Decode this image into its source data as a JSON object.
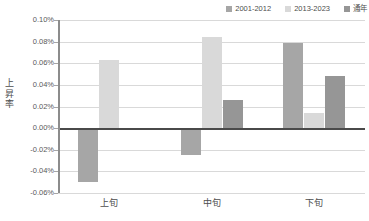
{
  "chart_data": {
    "type": "bar",
    "title": "",
    "xlabel": "",
    "ylabel": "上昇率",
    "categories": [
      "上旬",
      "中旬",
      "下旬"
    ],
    "series": [
      {
        "name": "2001-2012",
        "values": [
          -0.05,
          -0.025,
          0.079
        ],
        "color": "#a6a6a6"
      },
      {
        "name": "2013-2023",
        "values": [
          0.063,
          0.084,
          0.014
        ],
        "color": "#d9d9d9"
      },
      {
        "name": "通年",
        "values": [
          0.0,
          0.026,
          0.048
        ],
        "color": "#969696"
      }
    ],
    "ylim": [
      -0.06,
      0.1
    ],
    "ytick_step": 0.02,
    "ytick_labels": [
      "0.10%",
      "0.08%",
      "0.06%",
      "0.04%",
      "0.02%",
      "0.00%",
      "-0.02%",
      "-0.04%",
      "-0.06%"
    ],
    "ytick_values": [
      0.1,
      0.08,
      0.06,
      0.04,
      0.02,
      0.0,
      -0.02,
      -0.04,
      -0.06
    ],
    "value_suffix": "%",
    "grid": true,
    "legend_position": "top-right",
    "zero_line": 0.0
  },
  "legend": {
    "entries": [
      {
        "label": "2001-2012",
        "color": "#a6a6a6"
      },
      {
        "label": "2013-2023",
        "color": "#d9d9d9"
      },
      {
        "label": "通年",
        "color": "#969696"
      }
    ]
  },
  "axis_title": {
    "y_chars": [
      "上",
      "昇",
      "率"
    ]
  },
  "colors": {
    "gridline": "#d9d9d9",
    "zero_line": "#4a4a4a",
    "axis_line": "#8c8c8c",
    "text": "#4d4d4d",
    "background": "#ffffff"
  }
}
